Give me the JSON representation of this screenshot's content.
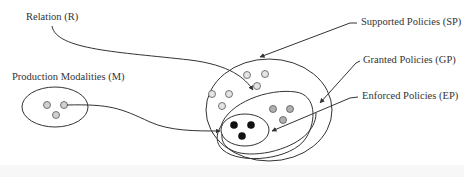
{
  "diagram": {
    "labels": {
      "relation": "Relation (R)",
      "production_modalities": "Production Modalities (M)",
      "supported_policies": "Supported Policies (SP)",
      "granted_policies": "Granted Policies (GP)",
      "enforced_policies": "Enforced Policies (EP)"
    },
    "colors": {
      "stroke": "#333333",
      "light_dot": "#e0e0e0",
      "mid_dot": "#b0b0b0",
      "dark_dot": "#111111",
      "background": "#ffffff"
    },
    "sets": [
      {
        "name": "Production Modalities (M)",
        "elements": 3,
        "dot_shade": "light"
      },
      {
        "name": "Supported Policies (SP)",
        "elements": 6,
        "dot_shade": "light"
      },
      {
        "name": "Granted Policies (GP)",
        "elements": 3,
        "dot_shade": "mid"
      },
      {
        "name": "Enforced Policies (EP)",
        "elements": 3,
        "dot_shade": "dark"
      }
    ]
  }
}
